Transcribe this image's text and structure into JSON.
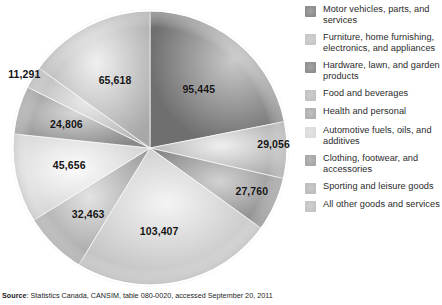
{
  "chart_data": {
    "type": "pie",
    "title": "",
    "subtitle": "",
    "xlabel": "",
    "ylabel": "",
    "legend_position": "right",
    "grid": false,
    "start_angle_deg": 0,
    "direction": "clockwise",
    "total": 435502,
    "categories": [
      "Motor vehicles, parts, and services",
      "Furniture, home furnishing, electronics, and appliances",
      "Hardware, lawn, and garden products",
      "Food and beverages",
      "Health and personal",
      "Automotive fuels, oils, and additives",
      "Clothing, footwear, and accessories",
      "Sporting and leisure goods",
      "All other goods and services"
    ],
    "values": [
      95445,
      29056,
      27760,
      103407,
      32463,
      45656,
      24806,
      11291,
      65618
    ],
    "labels": [
      "95,445",
      "29,056",
      "27,760",
      "103,407",
      "32,463",
      "45,656",
      "24,806",
      "11,291",
      "65,618"
    ],
    "colors": [
      "#8c8c8c",
      "#bdbdbd",
      "#9a9a9a",
      "#d0d0d0",
      "#b3b3b3",
      "#e0e0e0",
      "#9f9f9f",
      "#c9c9c9",
      "#bcbcbc"
    ]
  },
  "legend": {
    "items": [
      {
        "label": "Motor vehicles, parts, and services",
        "swatch": "#8c8c8c"
      },
      {
        "label": "Furniture, home furnishing, electronics, and appliances",
        "swatch": "#c6c6c6"
      },
      {
        "label": "Hardware, lawn, and garden products",
        "swatch": "#8f8f8f"
      },
      {
        "label": "Food and beverages",
        "swatch": "#c2c2c2"
      },
      {
        "label": "Health and personal",
        "swatch": "#b0b0b0"
      },
      {
        "label": "Automotive fuels, oils, and additives",
        "swatch": "#dcdcdc"
      },
      {
        "label": "Clothing, footwear, and accessories",
        "swatch": "#a6a6a6"
      },
      {
        "label": "Sporting and leisure goods",
        "swatch": "#bdbdbd"
      },
      {
        "label": "All other goods and services",
        "swatch": "#c4c4c4"
      }
    ]
  },
  "source": {
    "bold_prefix": "Source",
    "text": ": Statistics Canada, CANSIM, table 080-0020, accessed September 20, 2011"
  }
}
